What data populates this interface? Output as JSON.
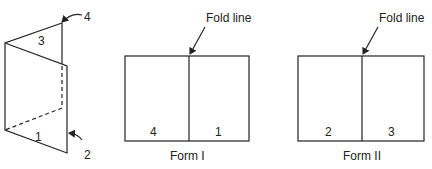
{
  "folded_sheet": {
    "panel_labels": [
      "1",
      "2",
      "3",
      "4"
    ]
  },
  "form_one": {
    "fold_label": "Fold line",
    "left_page": "4",
    "right_page": "1",
    "caption": "Form I"
  },
  "form_two": {
    "fold_label": "Fold line",
    "left_page": "2",
    "right_page": "3",
    "caption": "Form II"
  }
}
